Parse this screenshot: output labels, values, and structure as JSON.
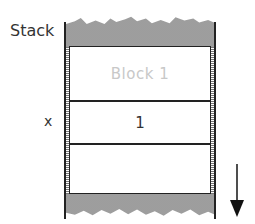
{
  "diagram": {
    "title_label": "Stack",
    "variable_label": "x",
    "slots": [
      {
        "label": "Block 1",
        "style": "faded"
      },
      {
        "label": "1",
        "style": "normal"
      },
      {
        "label": "",
        "style": "normal"
      }
    ],
    "arrow": {
      "direction": "down",
      "icon": "arrow-down-icon"
    },
    "colors": {
      "lines": "#222222",
      "text": "#333333",
      "faded_text": "#c8c8c8",
      "stipple": "#9a9a9a",
      "background": "#ffffff"
    }
  }
}
